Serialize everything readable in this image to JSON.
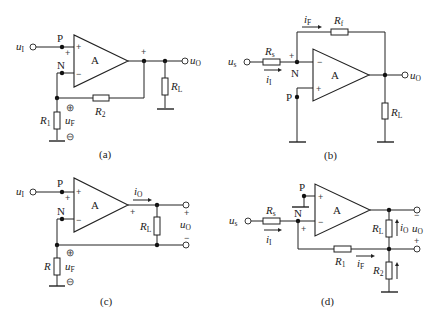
{
  "figure": {
    "panels": [
      {
        "id": "a",
        "caption": "(a)",
        "amp_label": "A",
        "input_label": "u",
        "input_sub": "I",
        "output_label": "u",
        "output_sub": "O",
        "node_p": "P",
        "node_n": "N",
        "load": {
          "name": "R",
          "sub": "L"
        },
        "feedback_resistor": {
          "name": "R",
          "sub": "2"
        },
        "ground_resistor": {
          "name": "R",
          "sub": "1"
        },
        "feedback_voltage": {
          "name": "u",
          "sub": "F"
        },
        "plus_sign": "+",
        "minus_sign": "−",
        "circled_plus": "⊕",
        "circled_minus": "⊖"
      },
      {
        "id": "b",
        "caption": "(b)",
        "amp_label": "A",
        "input_label": "u",
        "input_sub": "s",
        "output_label": "u",
        "output_sub": "O",
        "node_p": "P",
        "node_n": "N",
        "source_resistor": {
          "name": "R",
          "sub": "s"
        },
        "feedback_resistor": {
          "name": "R",
          "sub": "f"
        },
        "load": {
          "name": "R",
          "sub": "L"
        },
        "input_current": {
          "name": "i",
          "sub": "I"
        },
        "feedback_current": {
          "name": "i",
          "sub": "F"
        },
        "plus_sign": "+",
        "minus_sign": "−"
      },
      {
        "id": "c",
        "caption": "(c)",
        "amp_label": "A",
        "input_label": "u",
        "input_sub": "I",
        "output_label": "u",
        "output_sub": "O",
        "node_p": "P",
        "node_n": "N",
        "load": {
          "name": "R",
          "sub": "L"
        },
        "sense_resistor": {
          "name": "R",
          "sub": ""
        },
        "feedback_voltage": {
          "name": "u",
          "sub": "F"
        },
        "output_current": {
          "name": "i",
          "sub": "O"
        },
        "plus_sign": "+",
        "minus_sign": "−",
        "circled_plus": "⊕",
        "circled_minus": "⊖"
      },
      {
        "id": "d",
        "caption": "(d)",
        "amp_label": "A",
        "input_label": "u",
        "input_sub": "s",
        "output_label": "u",
        "output_sub": "O",
        "node_p": "P",
        "node_n": "N",
        "source_resistor": {
          "name": "R",
          "sub": "s"
        },
        "feedback_resistor": {
          "name": "R",
          "sub": "1"
        },
        "sense_resistor": {
          "name": "R",
          "sub": "2"
        },
        "load": {
          "name": "R",
          "sub": "L"
        },
        "input_current": {
          "name": "i",
          "sub": "I"
        },
        "feedback_current": {
          "name": "i",
          "sub": "F"
        },
        "output_current": {
          "name": "i",
          "sub": "O"
        },
        "plus_sign": "+",
        "minus_sign": "−"
      }
    ]
  }
}
